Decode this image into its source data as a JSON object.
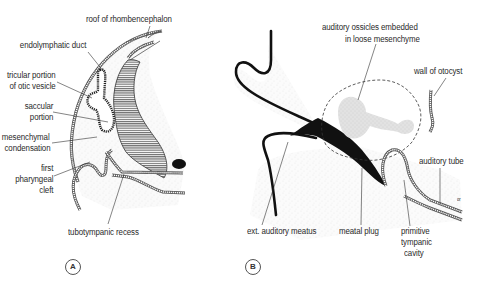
{
  "figure": {
    "panels": [
      {
        "id": "A",
        "tag": "A",
        "labels": {
          "roof": "roof of rhombencephalon",
          "endolymphatic_duct": "endolymphatic duct",
          "utricular_1": "tricular portion",
          "utricular_2": "of otic vesicle",
          "saccular_1": "saccular",
          "saccular_2": "portion",
          "mesenchymal_1": "mesenchymal",
          "mesenchymal_2": "condensation",
          "pharyngeal_1": "first",
          "pharyngeal_2": "pharyngeal",
          "pharyngeal_3": "cleft",
          "tubotympanic": "tubotympanic recess"
        }
      },
      {
        "id": "B",
        "tag": "B",
        "labels": {
          "ossicles_1": "auditory ossicles embedded",
          "ossicles_2": "in loose mesenchyme",
          "otocyst": "wall of otocyst",
          "auditory_tube": "auditory tube",
          "meatus": "ext. auditory meatus",
          "meatal_plug": "meatal plug",
          "tympanic_1": "primitive",
          "tympanic_2": "tympanic",
          "tympanic_3": "cavity",
          "tiny_mark": "or"
        }
      }
    ],
    "colors": {
      "ink": "#1a1a1a",
      "hatch": "#444444",
      "stipple": "#e6e6e6",
      "ossicle_fill": "#dcdcdc",
      "background": "#ffffff"
    }
  }
}
